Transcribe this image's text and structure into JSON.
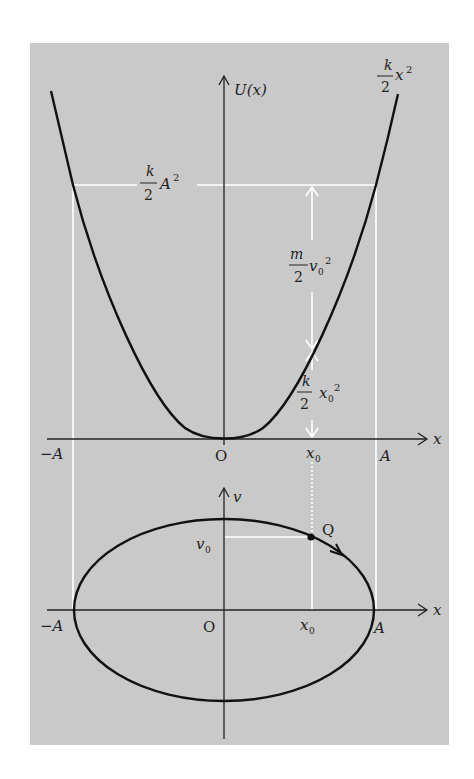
{
  "figure": {
    "background": "#ffffff",
    "panel_color": "#c9c9c9",
    "curve_color": "#111111",
    "guide_color": "#ffffff"
  },
  "top_plot": {
    "y_axis_label": "U(x)",
    "x_axis_label": "x",
    "curve_label_num": "k",
    "curve_label_den": "2",
    "curve_label_tail": "x",
    "curve_label_exp": "2",
    "energy_label_num": "k",
    "energy_label_den": "2",
    "energy_label_tail": "A",
    "energy_label_exp": "2",
    "kinetic_label_num": "m",
    "kinetic_label_den": "2",
    "kinetic_label_tail": "v",
    "kinetic_label_sub": "0",
    "kinetic_label_exp": "2",
    "potential_label_num": "k",
    "potential_label_den": "2",
    "potential_label_tail": "x",
    "potential_label_sub": "0",
    "potential_label_exp": "2",
    "tick_neg_A": "−A",
    "tick_origin": "O",
    "tick_x0": "x",
    "tick_x0_sub": "0",
    "tick_A": "A"
  },
  "bottom_plot": {
    "y_axis_label": "v",
    "x_axis_label": "x",
    "v0_label": "v",
    "v0_sub": "0",
    "point_label": "Q",
    "tick_neg_A": "−A",
    "tick_origin": "O",
    "tick_x0": "x",
    "tick_x0_sub": "0",
    "tick_A": "A"
  }
}
